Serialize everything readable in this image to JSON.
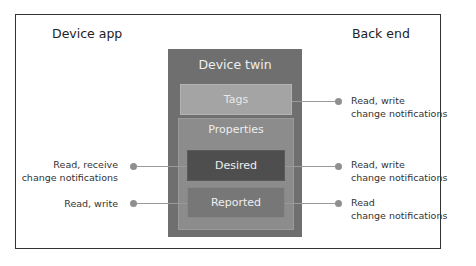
{
  "headings": {
    "device_app": "Device app",
    "back_end": "Back end"
  },
  "twin": {
    "title": "Device twin",
    "tags": "Tags",
    "properties": "Properties",
    "desired": "Desired",
    "reported": "Reported"
  },
  "connections": {
    "tags_backend": {
      "line1": "Read, write",
      "line2": "change notifications"
    },
    "desired_device": {
      "line1": "Read, receive",
      "line2": "change notifications"
    },
    "desired_backend": {
      "line1": "Read, write",
      "line2": "change notifications"
    },
    "reported_device": {
      "line1": "Read, write"
    },
    "reported_backend": {
      "line1": "Read",
      "line2": "change notifications"
    }
  },
  "colors": {
    "twin": "#6f6f6f",
    "tags": "#a4a4a4",
    "properties": "#8c8c8c",
    "desired": "#4e4e4e",
    "reported": "#777777",
    "connector": "#9a9a9a"
  }
}
